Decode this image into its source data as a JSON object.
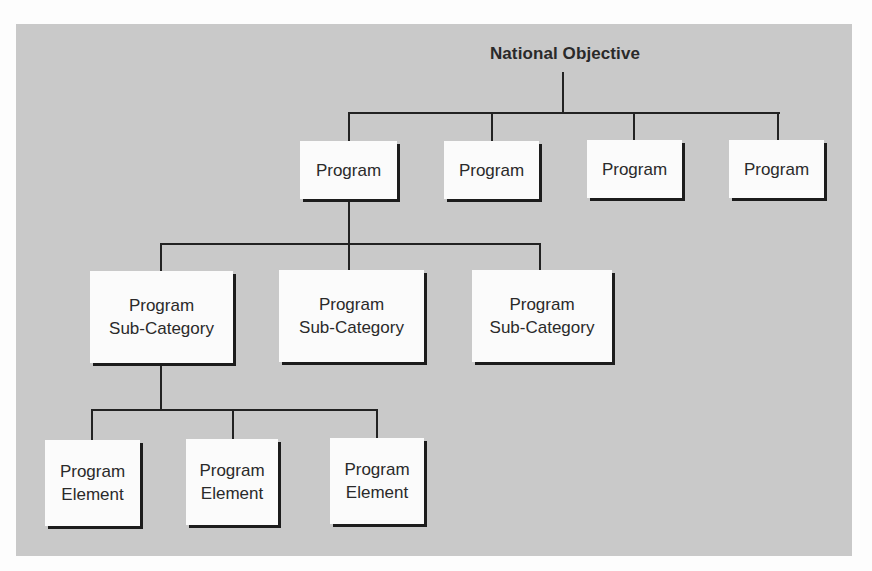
{
  "diagram": {
    "type": "hierarchy",
    "root": {
      "label": "National Objective"
    },
    "programs": [
      {
        "label": "Program"
      },
      {
        "label": "Program"
      },
      {
        "label": "Program"
      },
      {
        "label": "Program"
      }
    ],
    "sub_categories": [
      {
        "label": "Program\nSub-Category"
      },
      {
        "label": "Program\nSub-Category"
      },
      {
        "label": "Program\nSub-Category"
      }
    ],
    "elements": [
      {
        "label": "Program\nElement"
      },
      {
        "label": "Program\nElement"
      },
      {
        "label": "Program\nElement"
      }
    ],
    "colors": {
      "background": "#c9c9c9",
      "box_fill": "#fbfbfb",
      "line": "#222222",
      "shadow": "#1c1c1c"
    }
  }
}
